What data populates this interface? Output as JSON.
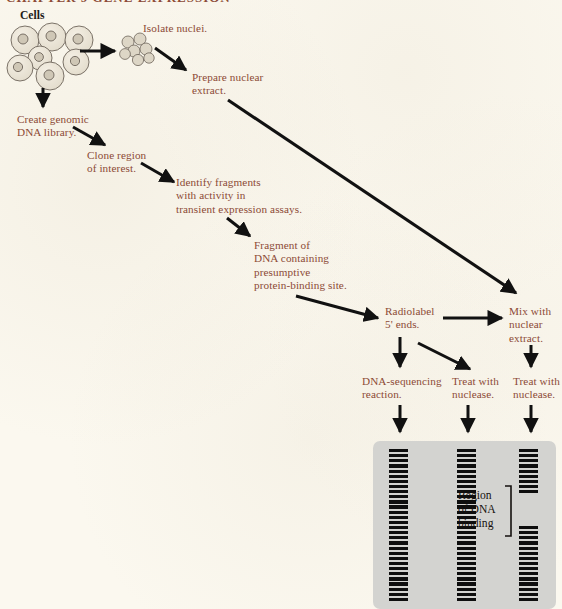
{
  "figure": {
    "title_fragment": "CHAPTER 9   GENE EXPRESSION",
    "background_color": "#fbf8ef",
    "arrow_color": "#111111",
    "label_color": "#8c4a36",
    "gel_color": "#d3d3d0",
    "band_color": "#0e0e0e"
  },
  "steps": {
    "cells": "Cells",
    "isolate_nuclei": "Isolate nuclei.",
    "prepare_nuclear_extract": "Prepare nuclear\nextract.",
    "create_genomic_library": "Create genomic\nDNA library.",
    "clone_region": "Clone region\nof interest.",
    "identify_fragments": "Identify fragments\nwith activity in\ntransient expression assays.",
    "fragment_of_dna": "Fragment of\nDNA containing\npresumptive\nprotein-binding site.",
    "radiolabel": "Radiolabel\n5' ends.",
    "mix_with_extract": "Mix with\nnuclear\nextract.",
    "dna_sequencing": "DNA-sequencing\nreaction.",
    "treat_nuclease_2": "Treat with\nnuclease.",
    "treat_nuclease_3": "Treat with\nnuclease."
  },
  "gel": {
    "region_label": "Region\nof DNA\nbinding",
    "lanes": [
      {
        "name": "lane-1-sequencing-ladder",
        "x": 389,
        "width": 19,
        "bands": 30,
        "gap_start": -1,
        "gap_count": 0
      },
      {
        "name": "lane-2-free-dna",
        "x": 457,
        "width": 19,
        "bands": 30,
        "gap_start": -1,
        "gap_count": 0
      },
      {
        "name": "lane-3-footprint",
        "x": 519,
        "width": 19,
        "bands": 30,
        "gap_start": 9,
        "gap_count": 6
      }
    ],
    "band_count_per_lane": 30,
    "footprint_gap_bands": 6
  },
  "counts": {
    "cells_in_cluster": 7,
    "nuclei_in_cluster": 7
  }
}
